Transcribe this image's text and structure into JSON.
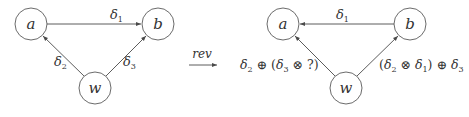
{
  "left_graph": {
    "nodes": [
      {
        "id": "a",
        "label": "a"
      },
      {
        "id": "b",
        "label": "b"
      },
      {
        "id": "w",
        "label": "w"
      }
    ],
    "edges": [
      {
        "from": "a",
        "to": "b",
        "label_base": "δ",
        "label_sub": "1"
      },
      {
        "from": "w",
        "to": "a",
        "label_base": "δ",
        "label_sub": "2"
      },
      {
        "from": "w",
        "to": "b",
        "label_base": "δ",
        "label_sub": "3"
      }
    ]
  },
  "transform": {
    "label": "rev"
  },
  "right_graph": {
    "nodes": [
      {
        "id": "a",
        "label": "a"
      },
      {
        "id": "b",
        "label": "b"
      },
      {
        "id": "w",
        "label": "w"
      }
    ],
    "edges": [
      {
        "from": "b",
        "to": "a",
        "label_base": "δ",
        "label_sub": "1"
      },
      {
        "from": "w",
        "to": "a",
        "label_text": "δ2 ⊕ (δ3 ⊗ ?)",
        "parts": {
          "d": "δ",
          "s2": "2",
          "plus": " ⊕ (",
          "s3": "3",
          "times": " ⊗ ?)"
        }
      },
      {
        "from": "w",
        "to": "b",
        "label_text": "(δ2 ⊗ δ1) ⊕ δ3",
        "parts": {
          "open": "(",
          "d": "δ",
          "s2": "2",
          "times": " ⊗ ",
          "s1": "1",
          "plus": ") ⊕ ",
          "s3": "3"
        }
      }
    ]
  }
}
